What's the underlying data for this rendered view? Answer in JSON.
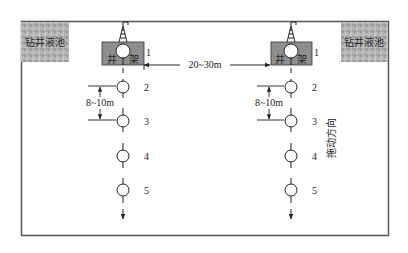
{
  "diagram": {
    "title": "",
    "colors": {
      "frame": "#555555",
      "pit_fill": "#a8a8a8",
      "rig_fill": "#8e8e8e",
      "line": "#222222",
      "background": "#ffffff"
    },
    "mud_pit_left": {
      "label": "钻井液池"
    },
    "mud_pit_right": {
      "label": "钻井液池"
    },
    "rig_left": {
      "label_left": "井",
      "label_right": "架"
    },
    "rig_right": {
      "label_left": "井",
      "label_right": "架"
    },
    "well_numbers": [
      "1",
      "2",
      "3",
      "4",
      "5"
    ],
    "spacing_between_rows": "20~30m",
    "spacing_between_wells_left": "8~10m",
    "spacing_between_wells_right": "8~10m",
    "move_direction": "拖动方向"
  }
}
